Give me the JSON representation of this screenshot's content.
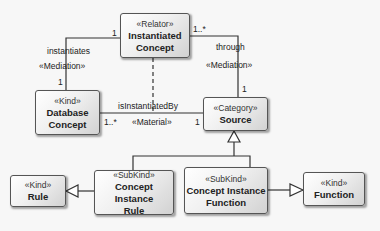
{
  "diagram": {
    "type": "UML class diagram (OntoUML)",
    "classes": [
      {
        "id": "instantiated_concept",
        "stereotype": "«Relator»",
        "name_lines": [
          "Instantiated",
          "Concept"
        ]
      },
      {
        "id": "database_concept",
        "stereotype": "«Kind»",
        "name_lines": [
          "Database",
          "Concept"
        ]
      },
      {
        "id": "source",
        "stereotype": "«Category»",
        "name_lines": [
          "Source"
        ]
      },
      {
        "id": "rule",
        "stereotype": "«Kind»",
        "name_lines": [
          "Rule"
        ]
      },
      {
        "id": "concept_instance_rule",
        "stereotype": "«SubKind»",
        "name_lines": [
          "Concept Instance",
          "Rule"
        ]
      },
      {
        "id": "concept_instance_function",
        "stereotype": "«SubKind»",
        "name_lines": [
          "Concept Instance",
          "Function"
        ]
      },
      {
        "id": "function",
        "stereotype": "«Kind»",
        "name_lines": [
          "Function"
        ]
      }
    ],
    "associations": [
      {
        "from": "instantiated_concept",
        "to": "database_concept",
        "name": "instantiates",
        "stereotype": "«Mediation»",
        "mult_from": "1",
        "mult_to": "1"
      },
      {
        "from": "instantiated_concept",
        "to": "source",
        "name": "through",
        "stereotype": "«Mediation»",
        "mult_from": "1..*",
        "mult_to": "1"
      },
      {
        "from": "database_concept",
        "to": "source",
        "name": "isInstantiatedBy",
        "stereotype": "«Material»",
        "mult_from": "1..*",
        "mult_to": "1"
      }
    ],
    "generalizations": [
      {
        "child": "concept_instance_rule",
        "parent": "source"
      },
      {
        "child": "concept_instance_function",
        "parent": "source"
      },
      {
        "child": "concept_instance_rule",
        "parent": "rule"
      },
      {
        "child": "concept_instance_function",
        "parent": "function"
      }
    ]
  },
  "labels": {
    "instantiates": "instantiates",
    "mediation_left": "«Mediation»",
    "mult_ic_left": "1",
    "mult_db_top": "1",
    "through": "through",
    "mediation_right": "«Mediation»",
    "mult_ic_right": "1..*",
    "mult_src_top": "1",
    "is_instantiated_by": "isInstantiatedBy",
    "material": "«Material»",
    "mult_db_right": "1..*",
    "mult_src_left": "1"
  }
}
